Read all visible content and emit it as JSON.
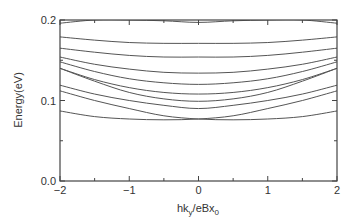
{
  "chart_data": {
    "type": "line",
    "title": "",
    "xlabel": "hk_y/eBx_0",
    "ylabel": "Energy(eV)",
    "xlim": [
      -2,
      2
    ],
    "ylim": [
      0.0,
      0.2
    ],
    "xticks": [
      -2,
      -1,
      0,
      1,
      2
    ],
    "xtick_labels": [
      "-2",
      "-1",
      "0",
      "1",
      "2"
    ],
    "yticks": [
      0.0,
      0.1,
      0.2
    ],
    "ytick_labels": [
      "0.0",
      "0.1",
      "0.2"
    ],
    "grid": false,
    "legend": null,
    "x": [
      -2,
      -1.5,
      -1,
      -0.5,
      0,
      0.5,
      1,
      1.5,
      2
    ],
    "series": [
      {
        "name": "band-1",
        "values": [
          0.196,
          0.2,
          0.2,
          0.199,
          0.197,
          0.199,
          0.2,
          0.2,
          0.196
        ]
      },
      {
        "name": "band-2",
        "values": [
          0.179,
          0.175,
          0.172,
          0.171,
          0.171,
          0.171,
          0.172,
          0.175,
          0.179
        ]
      },
      {
        "name": "band-3",
        "values": [
          0.165,
          0.16,
          0.156,
          0.154,
          0.154,
          0.154,
          0.156,
          0.16,
          0.165
        ]
      },
      {
        "name": "band-4",
        "values": [
          0.154,
          0.145,
          0.139,
          0.135,
          0.134,
          0.135,
          0.139,
          0.145,
          0.154
        ]
      },
      {
        "name": "band-5",
        "values": [
          0.148,
          0.136,
          0.127,
          0.122,
          0.12,
          0.122,
          0.127,
          0.136,
          0.148
        ]
      },
      {
        "name": "band-6",
        "values": [
          0.14,
          0.126,
          0.116,
          0.11,
          0.108,
          0.11,
          0.116,
          0.126,
          0.14
        ]
      },
      {
        "name": "band-7",
        "values": [
          0.14,
          0.124,
          0.11,
          0.102,
          0.099,
          0.102,
          0.11,
          0.124,
          0.14
        ]
      },
      {
        "name": "band-8",
        "values": [
          0.119,
          0.108,
          0.1,
          0.094,
          0.09,
          0.094,
          0.1,
          0.108,
          0.119
        ]
      },
      {
        "name": "crossing-band-a",
        "values": [
          0.087,
          0.08,
          0.077,
          0.076,
          0.077,
          0.081,
          0.09,
          0.1,
          0.112
        ]
      },
      {
        "name": "crossing-band-b",
        "values": [
          0.112,
          0.1,
          0.09,
          0.081,
          0.077,
          0.076,
          0.077,
          0.08,
          0.087
        ]
      }
    ]
  },
  "labels": {
    "ylabel": "Energy(eV)",
    "xlabel_main": "hk",
    "xlabel_sub1": "y",
    "xlabel_mid": "/eBx",
    "xlabel_sub2": "0"
  }
}
